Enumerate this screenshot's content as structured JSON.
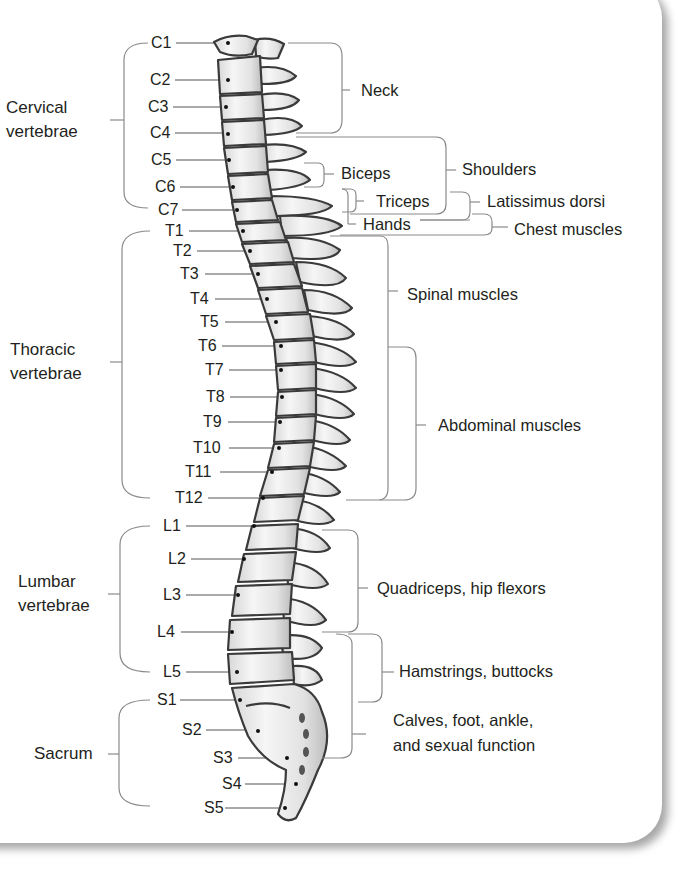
{
  "figure": {
    "type": "spinal column nerve-function diagram",
    "colors": {
      "bracket": "#8a8a8a",
      "text": "#231f20",
      "bone_fill": "#efefef",
      "bone_outline": "#3a3a3a",
      "card_shadow": "#9a9a9a"
    }
  },
  "regions": [
    {
      "id": "cervical",
      "line1": "Cervical",
      "line2": "vertebrae"
    },
    {
      "id": "thoracic",
      "line1": "Thoracic",
      "line2": "vertebrae"
    },
    {
      "id": "lumbar",
      "line1": "Lumbar",
      "line2": "vertebrae"
    },
    {
      "id": "sacrum",
      "line1": "Sacrum",
      "line2": ""
    }
  ],
  "vertebrae": {
    "cervical": [
      "C1",
      "C2",
      "C3",
      "C4",
      "C5",
      "C6",
      "C7"
    ],
    "thoracic": [
      "T1",
      "T2",
      "T3",
      "T4",
      "T5",
      "T6",
      "T7",
      "T8",
      "T9",
      "T10",
      "T11",
      "T12"
    ],
    "lumbar": [
      "L1",
      "L2",
      "L3",
      "L4",
      "L5"
    ],
    "sacral": [
      "S1",
      "S2",
      "S3",
      "S4",
      "S5"
    ]
  },
  "muscle_groups": [
    {
      "label": "Neck",
      "span": "C1–C4"
    },
    {
      "label": "Shoulders",
      "span": "C4–C7"
    },
    {
      "label": "Biceps",
      "span": "C5–C6"
    },
    {
      "label": "Triceps",
      "span": "C6–C7"
    },
    {
      "label": "Latissimus dorsi",
      "span": "C6–C8"
    },
    {
      "label": "Hands",
      "span": "C7–T1"
    },
    {
      "label": "Chest muscles",
      "span": "C7–T1"
    },
    {
      "label": "Spinal muscles",
      "span": "T1–T12"
    },
    {
      "label": "Abdominal muscles",
      "span": "T6–T12"
    },
    {
      "label": "Quadriceps, hip flexors",
      "span": "L1–L4"
    },
    {
      "label": "Hamstrings, buttocks",
      "span": "L4–S1"
    },
    {
      "label": "Calves, foot, ankle,",
      "label2": "and sexual function",
      "span": "L4–S2"
    }
  ]
}
